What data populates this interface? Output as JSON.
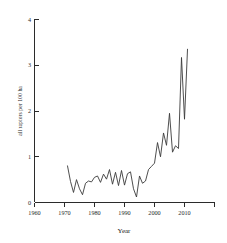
{
  "chart_data": {
    "type": "line",
    "title": "",
    "xlabel": "Year",
    "ylabel": "all raptors per 100 ha",
    "xlim": [
      1960,
      2016
    ],
    "ylim": [
      0,
      4
    ],
    "grid": false,
    "legend": "none",
    "xticks": [
      1960,
      1970,
      1980,
      1990,
      2000,
      2010
    ],
    "xtick_labels": [
      "1960",
      "1970",
      "1980",
      "1990",
      "2000",
      "2010"
    ],
    "yticks": [
      0,
      1,
      2,
      3,
      4
    ],
    "ytick_labels": [
      "0",
      "1",
      "2",
      "3",
      "4"
    ],
    "line_color": "#3a3a3a",
    "axis_color": "#2b2b2b",
    "background_color": "#ffffff",
    "series": [
      {
        "name": "all raptors per 100 ha",
        "x": [
          1971,
          1972,
          1973,
          1974,
          1975,
          1976,
          1977,
          1978,
          1979,
          1980,
          1981,
          1982,
          1983,
          1984,
          1985,
          1986,
          1987,
          1988,
          1989,
          1990,
          1991,
          1992,
          1993,
          1994,
          1995,
          1996,
          1997,
          1998,
          1999,
          2000,
          2001,
          2002,
          2003,
          2004,
          2005,
          2006,
          2007,
          2008,
          2009,
          2010,
          2011
        ],
        "values": [
          0.8,
          0.46,
          0.22,
          0.5,
          0.3,
          0.17,
          0.42,
          0.47,
          0.45,
          0.55,
          0.58,
          0.44,
          0.62,
          0.51,
          0.72,
          0.4,
          0.66,
          0.37,
          0.7,
          0.38,
          0.63,
          0.67,
          0.3,
          0.12,
          0.58,
          0.42,
          0.47,
          0.72,
          0.79,
          0.86,
          1.31,
          1.0,
          1.52,
          1.25,
          1.95,
          1.1,
          1.24,
          1.18,
          3.17,
          1.82,
          3.35
        ]
      }
    ]
  },
  "axis_labels": {
    "x_title": "Year",
    "y_title": "all raptors per 100 ha"
  }
}
